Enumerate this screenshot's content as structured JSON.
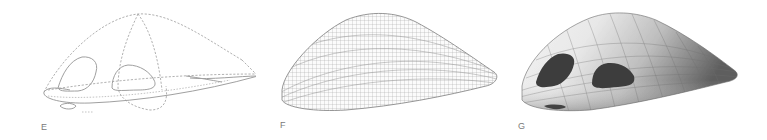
{
  "figure": {
    "panels": [
      {
        "id": "E",
        "label": "E",
        "description": "Dashed construction curves of vehicle body with window outlines"
      },
      {
        "id": "F",
        "label": "F",
        "description": "Dense wireframe mesh surface of vehicle body"
      },
      {
        "id": "G",
        "label": "G",
        "description": "Shaded rendered surface with dark window openings"
      }
    ],
    "colors": {
      "background": "#ffffff",
      "label": "#7a7a7a",
      "construction_line": "#a8a8a8",
      "mesh_line": "#9a9a9a",
      "body_light": "#f2f2f2",
      "body_dark": "#6a6a6a",
      "window": "#3d3d3d"
    }
  }
}
